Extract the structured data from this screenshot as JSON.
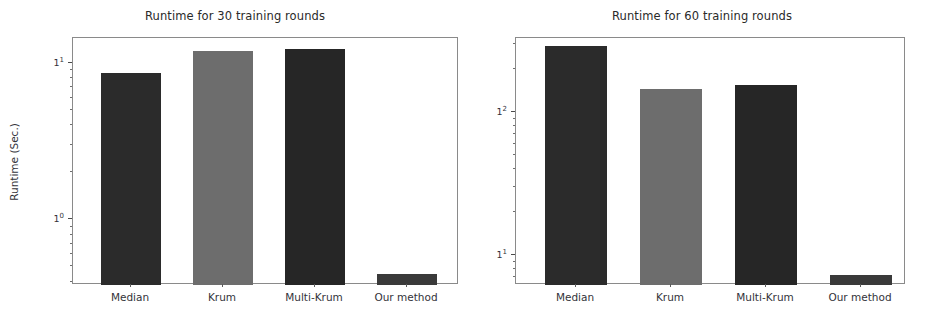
{
  "figure": {
    "background": "#ffffff",
    "width": 937,
    "height": 323
  },
  "chart_data": [
    {
      "type": "bar",
      "panel": "left",
      "title": "Runtime for 30 training rounds",
      "xlabel": "",
      "ylabel": "Runtime (Sec.)",
      "yscale": "log",
      "ylim": [
        0.38,
        14.5
      ],
      "grid": false,
      "legend": "none",
      "categories": [
        "Median",
        "Krum",
        "Multi-Krum",
        "Our method"
      ],
      "values": [
        8.7,
        12.0,
        12.3,
        0.45
      ],
      "bar_colors": [
        "#2b2b2b",
        "#6d6d6d",
        "#262626",
        "#3a3a3a"
      ],
      "ytick_labels": [
        "10⁰",
        "10¹"
      ],
      "ytick_values": [
        1,
        10
      ],
      "ytick_mantissa": [
        "1",
        "1"
      ],
      "ytick_exponent": [
        "0",
        "1"
      ]
    },
    {
      "type": "bar",
      "panel": "right",
      "title": "Runtime for 60 training rounds",
      "xlabel": "",
      "ylabel": "",
      "yscale": "log",
      "ylim": [
        6.2,
        330
      ],
      "grid": false,
      "legend": "none",
      "categories": [
        "Median",
        "Krum",
        "Multi-Krum",
        "Our method"
      ],
      "values": [
        290,
        145,
        155,
        7.3
      ],
      "bar_colors": [
        "#2b2b2b",
        "#6d6d6d",
        "#262626",
        "#3a3a3a"
      ],
      "ytick_labels": [
        "10¹",
        "10²"
      ],
      "ytick_values": [
        10,
        100
      ],
      "ytick_mantissa": [
        "1",
        "1"
      ],
      "ytick_exponent": [
        "1",
        "2"
      ]
    }
  ],
  "panels": {
    "left": {
      "title": "Runtime for 30 training rounds",
      "ylabel": "Runtime (Sec.)",
      "ticks": {
        "y0_mantissa": "10",
        "y0_exp": "0",
        "y1_mantissa": "10",
        "y1_exp": "1"
      },
      "xlabels": [
        "Median",
        "Krum",
        "Multi-Krum",
        "Our method"
      ]
    },
    "right": {
      "title": "Runtime for 60 training rounds",
      "ylabel": "",
      "ticks": {
        "y0_mantissa": "10",
        "y0_exp": "1",
        "y1_mantissa": "10",
        "y1_exp": "2"
      },
      "xlabels": [
        "Median",
        "Krum",
        "Multi-Krum",
        "Our method"
      ]
    }
  }
}
